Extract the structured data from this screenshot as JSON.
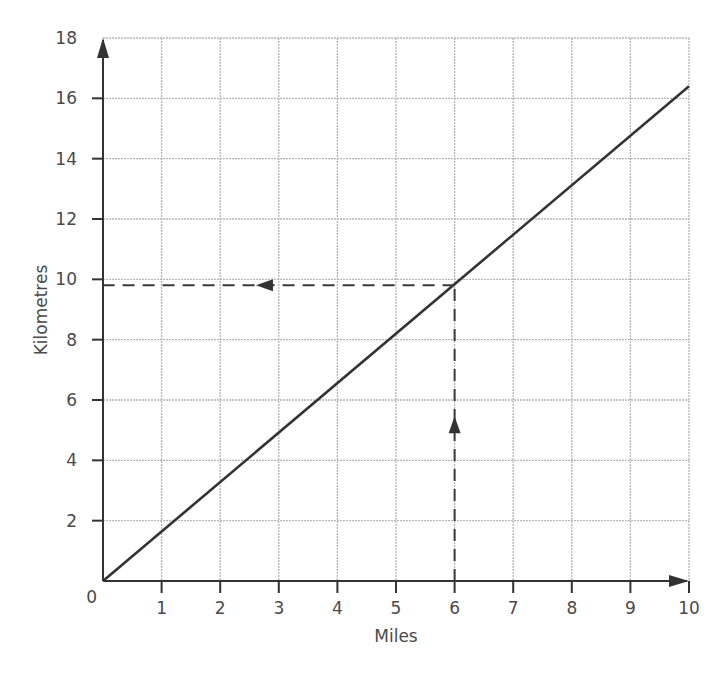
{
  "chart_data": {
    "type": "line",
    "title": "",
    "xlabel": "Miles",
    "ylabel": "Kilometres",
    "xlim": [
      0,
      10
    ],
    "ylim": [
      0,
      18
    ],
    "x_ticks": [
      "1",
      "2",
      "3",
      "4",
      "5",
      "6",
      "7",
      "8",
      "9",
      "10"
    ],
    "y_ticks": [
      "2",
      "4",
      "6",
      "8",
      "10",
      "12",
      "14",
      "16",
      "18"
    ],
    "origin_label": "0",
    "grid": true,
    "legend": null,
    "series": [
      {
        "name": "miles-to-km conversion",
        "x": [
          0,
          10
        ],
        "y": [
          0,
          16.4
        ],
        "style": "solid"
      }
    ],
    "annotations": [
      {
        "type": "dashed-arrow",
        "from": [
          6,
          0
        ],
        "to": [
          6,
          9.8
        ],
        "direction": "up",
        "description": "Read up from 6 miles to the line"
      },
      {
        "type": "dashed-arrow",
        "from": [
          6,
          9.8
        ],
        "to": [
          0,
          9.8
        ],
        "direction": "left",
        "description": "Read across to ~9.8 km"
      }
    ]
  }
}
